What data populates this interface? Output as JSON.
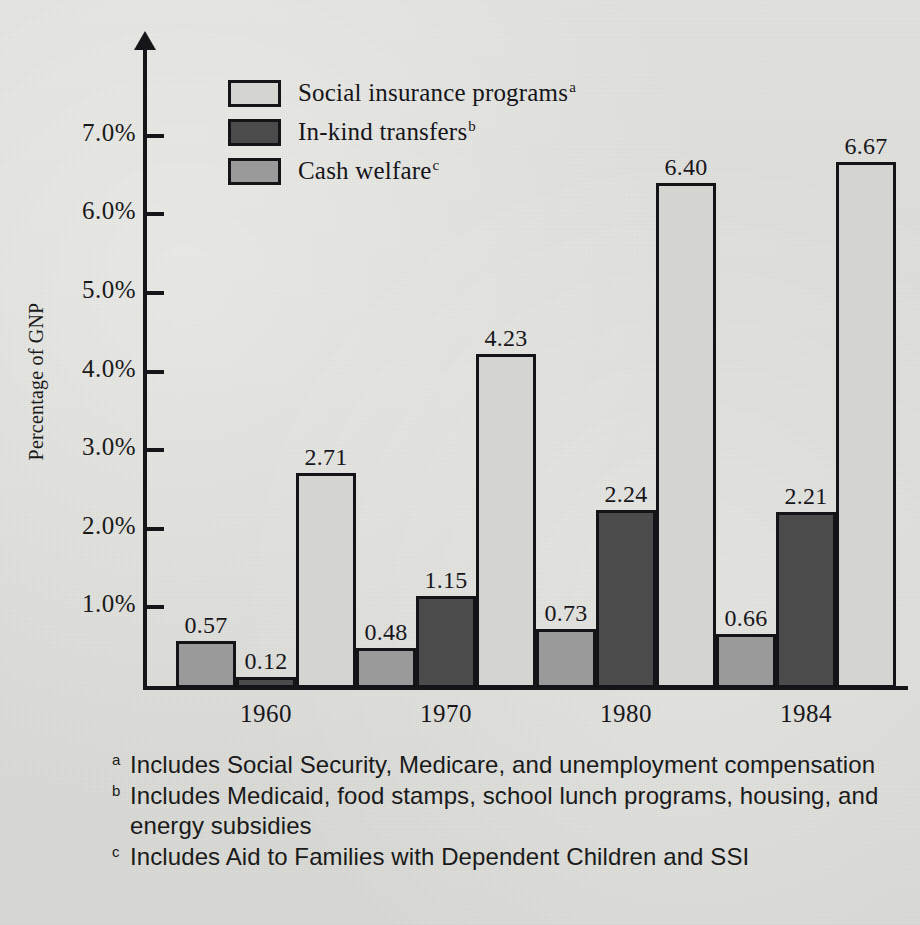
{
  "chart_data": {
    "type": "bar",
    "title": "",
    "xlabel": "",
    "ylabel": "Percentage of GNP",
    "categories": [
      "1960",
      "1970",
      "1980",
      "1984"
    ],
    "ylim": [
      0,
      7.6
    ],
    "y_ticks": [
      "1.0%",
      "2.0%",
      "3.0%",
      "4.0%",
      "5.0%",
      "6.0%",
      "7.0%"
    ],
    "y_tick_values": [
      1.0,
      2.0,
      3.0,
      4.0,
      5.0,
      6.0,
      7.0
    ],
    "grid": false,
    "legend_position": "top-center",
    "series": [
      {
        "name": "Cash welfare",
        "marker": "c",
        "color": "#9a9a9a",
        "values": [
          0.57,
          0.48,
          0.73,
          0.66
        ],
        "labels": [
          "0.57",
          "0.48",
          "0.73",
          "0.66"
        ]
      },
      {
        "name": "In-kind transfers",
        "marker": "b",
        "color": "#4b4b4b",
        "values": [
          0.12,
          1.15,
          2.24,
          2.21
        ],
        "labels": [
          "0.12",
          "1.15",
          "2.24",
          "2.21"
        ]
      },
      {
        "name": "Social insurance programs",
        "marker": "a",
        "color": "#d4d4d0",
        "values": [
          2.71,
          4.23,
          6.4,
          6.67
        ],
        "labels": [
          "2.71",
          "4.23",
          "6.40",
          "6.67"
        ]
      }
    ],
    "series_draw_order": [
      "Cash welfare",
      "In-kind transfers",
      "Social insurance programs"
    ]
  },
  "legend": {
    "items": [
      {
        "label": "Social insurance programs",
        "marker": "a",
        "color": "#d4d4d0"
      },
      {
        "label": "In-kind transfers",
        "marker": "b",
        "color": "#4b4b4b"
      },
      {
        "label": "Cash welfare",
        "marker": "c",
        "color": "#9a9a9a"
      }
    ]
  },
  "axis": {
    "y_title": "Percentage of GNP",
    "y_ticks": [
      "7.0%",
      "6.0%",
      "5.0%",
      "4.0%",
      "3.0%",
      "2.0%",
      "1.0%"
    ],
    "x_ticks": [
      "1960",
      "1970",
      "1980",
      "1984"
    ]
  },
  "footnotes": [
    {
      "marker": "a",
      "text": "Includes Social Security, Medicare, and unemployment compensation"
    },
    {
      "marker": "b",
      "text": "Includes Medicaid, food stamps, school lunch programs, housing, and energy subsidies"
    },
    {
      "marker": "c",
      "text": "Includes Aid to Families with Dependent Children and SSI"
    }
  ],
  "colors": {
    "background": "#dededa",
    "ink": "#15151a",
    "social_insurance": "#d4d4d0",
    "in_kind": "#4b4b4b",
    "cash_welfare": "#9a9a9a"
  }
}
